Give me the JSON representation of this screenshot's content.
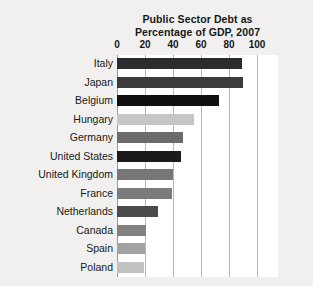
{
  "chart_data": {
    "type": "bar",
    "orientation": "horizontal",
    "title": "Public Sector Debt as Percentage of GDP, 2007",
    "title_lines": [
      "Public Sector Debt as",
      "Percentage of GDP, 2007"
    ],
    "xlabel": "",
    "ylabel": "",
    "xlim": [
      0,
      110
    ],
    "xticks": [
      0,
      20,
      40,
      60,
      80,
      100
    ],
    "xtick_labels": [
      "0",
      "20",
      "40",
      "60",
      "80",
      "100"
    ],
    "grid": true,
    "grid_axis": "x",
    "legend": false,
    "categories": [
      "Italy",
      "Japan",
      "Belgium",
      "Hungary",
      "Germany",
      "United States",
      "United Kingdom",
      "France",
      "Netherlands",
      "Canada",
      "Spain",
      "Poland"
    ],
    "values": [
      89,
      90,
      73,
      55,
      47,
      46,
      40,
      39,
      29,
      21,
      20,
      19
    ],
    "bar_colors": [
      "#2c2c2c",
      "#3b3b3b",
      "#101010",
      "#c6c6c6",
      "#6b6b6b",
      "#1b1b1b",
      "#777777",
      "#7b7b7b",
      "#4b4b4b",
      "#828282",
      "#a3a3a3",
      "#c2c2c2"
    ],
    "bars": [
      {
        "category": "Italy",
        "value": 89,
        "color": "#2c2c2c"
      },
      {
        "category": "Japan",
        "value": 90,
        "color": "#3b3b3b"
      },
      {
        "category": "Belgium",
        "value": 73,
        "color": "#101010"
      },
      {
        "category": "Hungary",
        "value": 55,
        "color": "#c6c6c6"
      },
      {
        "category": "Germany",
        "value": 47,
        "color": "#6b6b6b"
      },
      {
        "category": "United States",
        "value": 46,
        "color": "#1b1b1b"
      },
      {
        "category": "United Kingdom",
        "value": 40,
        "color": "#777777"
      },
      {
        "category": "France",
        "value": 39,
        "color": "#7b7b7b"
      },
      {
        "category": "Netherlands",
        "value": 29,
        "color": "#4b4b4b"
      },
      {
        "category": "Canada",
        "value": 21,
        "color": "#828282"
      },
      {
        "category": "Spain",
        "value": 20,
        "color": "#a3a3a3"
      },
      {
        "category": "Poland",
        "value": 19,
        "color": "#c2c2c2"
      }
    ]
  },
  "style": {
    "page_background": "#f1f0ee",
    "plot_background": "#ffffff",
    "gridline_color": "#b9b9b9",
    "text_color": "#15181c"
  }
}
